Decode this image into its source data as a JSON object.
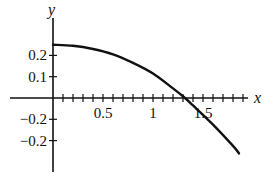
{
  "chart_data": {
    "type": "line",
    "title": "",
    "xlabel": "x",
    "ylabel": "y",
    "xlim": [
      0,
      2.05
    ],
    "ylim": [
      -0.31,
      0.27
    ],
    "x_tick_labels": [
      "0.5",
      "1",
      "1.5"
    ],
    "x_tick_values": [
      0.5,
      1,
      1.5
    ],
    "x_minor_tick_step": 0.1,
    "y_tick_labels": [
      "0.2",
      "0.1",
      "−0.2",
      "−0.2"
    ],
    "y_tick_values": [
      0.2,
      0.1,
      -0.1,
      -0.2
    ],
    "grid": false,
    "legend": null,
    "series": [
      {
        "name": "curve",
        "color": "#111111",
        "x": [
          0,
          0.2,
          0.4,
          0.6,
          0.8,
          1.0,
          1.2,
          1.32,
          1.4,
          1.6,
          1.8,
          1.86
        ],
        "y": [
          0.25,
          0.245,
          0.23,
          0.205,
          0.165,
          0.115,
          0.045,
          0.0,
          -0.035,
          -0.125,
          -0.225,
          -0.26
        ]
      }
    ]
  }
}
